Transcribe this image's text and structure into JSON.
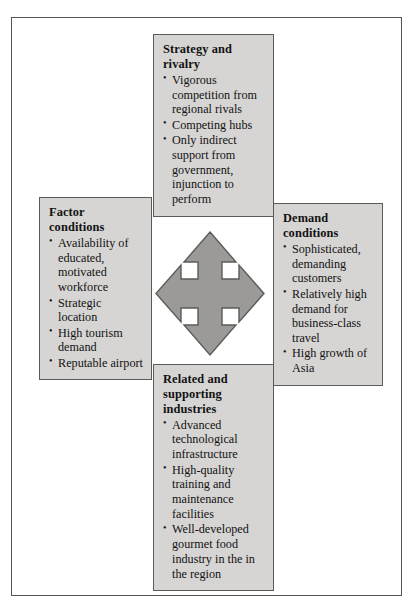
{
  "diagram": {
    "type": "porters-diamond",
    "colors": {
      "box_fill": "#d6d5d3",
      "box_border": "#5b5b57",
      "arrow_fill": "#9b9a98",
      "arrow_border": "#5b5b57",
      "page_background": "#ffffff",
      "frame_border": "#54544f",
      "text": "#121212"
    },
    "boxes": {
      "strategy": {
        "title": "Strategy and rivalry",
        "bullets": [
          "Vigorous competition from regional rivals",
          "Competing hubs",
          "Only indirect support from government, injunction to perform"
        ]
      },
      "factor": {
        "title": "Factor conditions",
        "bullets": [
          "Availability of educated, motivated workforce",
          "Strategic location",
          "High tourism demand",
          "Reputable airport"
        ]
      },
      "demand": {
        "title": "Demand conditions",
        "bullets": [
          "Sophisticated, demanding customers",
          "Relatively high demand for business-class travel",
          "High growth of Asia"
        ]
      },
      "related": {
        "title": "Related and supporting industries",
        "bullets": [
          "Advanced technological infrastructure",
          "High-quality training and maintenance facilities",
          "Well-developed gourmet food industry in the in the region"
        ]
      }
    },
    "center": {
      "icon": "four-way-arrow"
    }
  }
}
